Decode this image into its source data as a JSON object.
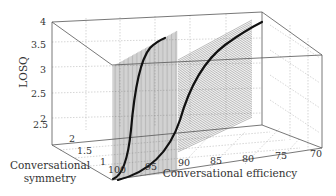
{
  "chart_data": {
    "type": "3d-surface-slices",
    "title": "",
    "zlabel": "LOSQ",
    "xlabel": "Conversational efficiency",
    "ylabel": "Conversational symmetry",
    "z_ticks": [
      "2",
      "2.5",
      "3",
      "3.5",
      "4"
    ],
    "x_ticks": [
      "100",
      "95",
      "90",
      "85",
      "80",
      "75",
      "70"
    ],
    "y_ticks": [
      "1",
      "1.5",
      "2",
      "2.5"
    ],
    "zlim": [
      2,
      4
    ],
    "xlim": [
      100,
      70
    ],
    "ylim": [
      1,
      2.5
    ],
    "grid": true,
    "series": [
      {
        "name": "slice near symmetry 1 (steep S-curve)",
        "x": [
          100,
          99,
          98,
          97,
          96,
          95
        ],
        "values": [
          2.0,
          2.4,
          3.0,
          3.5,
          3.75,
          3.85
        ]
      },
      {
        "name": "slice at higher symmetry (gradual S-curve)",
        "x": [
          100,
          97,
          94,
          91,
          88,
          85,
          82,
          79,
          76
        ],
        "values": [
          2.0,
          2.1,
          2.3,
          2.7,
          3.2,
          3.55,
          3.75,
          3.88,
          3.95
        ]
      }
    ]
  },
  "labels": {
    "z_axis": "LOSQ",
    "x_axis": "Conversational efficiency",
    "y_axis_line1": "Conversational",
    "y_axis_line2": "symmetry"
  },
  "ticks": {
    "z": [
      "4",
      "3.5",
      "3",
      "2.5",
      "2"
    ],
    "y": [
      "2.5",
      "2",
      "1.5",
      "1"
    ],
    "x": [
      "100",
      "95",
      "90",
      "85",
      "80",
      "75",
      "70"
    ]
  }
}
